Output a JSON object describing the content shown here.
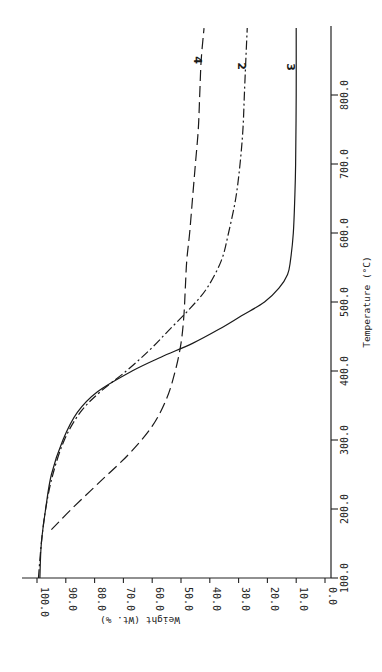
{
  "chart_data": {
    "type": "line",
    "title": "",
    "orientation": "rotated 90° clockwise (temperature axis vertical on right, weight axis horizontal at bottom)",
    "xlabel": "Temperature (°C)",
    "ylabel": "Weight (Wt. %)",
    "xlim": [
      100,
      900
    ],
    "ylim": [
      0,
      100
    ],
    "x_ticks": [
      "100.0",
      "200.0",
      "300.0",
      "400.0",
      "500.0",
      "600.0",
      "700.0",
      "800.0"
    ],
    "y_ticks": [
      "100.0",
      "90.0",
      "80.0",
      "70.0",
      "60.0",
      "50.0",
      "40.0",
      "30.0",
      "20.0",
      "10.0",
      "0.0"
    ],
    "grid": false,
    "legend": "inline curve labels at top: 4, 2, 3",
    "series": [
      {
        "name": "2",
        "style": "dash-dot",
        "x": [
          100,
          150,
          200,
          250,
          300,
          340,
          370,
          400,
          430,
          460,
          490,
          520,
          560,
          600,
          650,
          700,
          750,
          800,
          850,
          897
        ],
        "y": [
          99.5,
          98.5,
          97,
          94.5,
          90.5,
          85,
          78,
          69,
          61,
          54,
          47,
          41,
          36,
          33.5,
          31,
          29.5,
          28.5,
          28,
          27.5,
          27
        ]
      },
      {
        "name": "3",
        "style": "solid",
        "x": [
          100,
          150,
          200,
          250,
          300,
          340,
          370,
          400,
          420,
          440,
          460,
          480,
          500,
          520,
          540,
          560,
          600,
          650,
          700,
          800,
          897
        ],
        "y": [
          99,
          98.5,
          97,
          95,
          91,
          86,
          79,
          67,
          57,
          46,
          37,
          29,
          21,
          16,
          13,
          12,
          11,
          10.5,
          10.2,
          10,
          10
        ]
      },
      {
        "name": "4",
        "style": "dashed",
        "x": [
          170,
          200,
          240,
          280,
          320,
          360,
          400,
          440,
          480,
          520,
          560,
          600,
          650,
          700,
          750,
          800,
          850,
          897
        ],
        "y": [
          95,
          88,
          78,
          68,
          60,
          55,
          52,
          50,
          49,
          48.5,
          48,
          47,
          46,
          45,
          44,
          43.5,
          43,
          42
        ]
      }
    ]
  },
  "axes": {
    "weight_label": "Weight (Wt. %)",
    "temperature_label": "Temperature (°C)"
  }
}
